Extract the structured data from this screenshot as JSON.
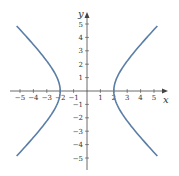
{
  "chart_data": {
    "type": "line",
    "title": "",
    "equation": "x^2 - y^2 = 4",
    "xlabel": "x",
    "ylabel": "y",
    "xlim": [
      -5,
      5
    ],
    "ylim": [
      -5,
      5
    ],
    "x_ticks": [
      -5,
      -4,
      -3,
      -2,
      -1,
      1,
      2,
      3,
      4,
      5
    ],
    "y_ticks": [
      -5,
      -4,
      -3,
      -2,
      -1,
      1,
      2,
      3,
      4,
      5
    ],
    "grid": false,
    "series": [
      {
        "name": "right branch",
        "color": "#5b7ea6",
        "x": [
          5,
          4,
          3,
          2.5,
          2.2,
          2,
          2.2,
          2.5,
          3,
          4,
          5
        ],
        "y": [
          4.58,
          3.46,
          2.24,
          1.5,
          0.92,
          0,
          -0.92,
          -1.5,
          -2.24,
          -3.46,
          -4.58
        ]
      },
      {
        "name": "left branch",
        "color": "#5b7ea6",
        "x": [
          -5,
          -4,
          -3,
          -2.5,
          -2.2,
          -2,
          -2.2,
          -2.5,
          -3,
          -4,
          -5
        ],
        "y": [
          4.58,
          3.46,
          2.24,
          1.5,
          0.92,
          0,
          -0.92,
          -1.5,
          -2.24,
          -3.46,
          -4.58
        ]
      }
    ]
  }
}
